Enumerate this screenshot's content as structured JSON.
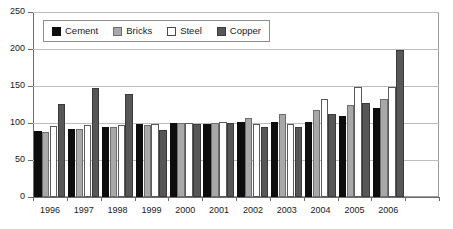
{
  "chart_data": {
    "type": "bar",
    "title": "",
    "subtitle": "",
    "xlabel": "",
    "ylabel": "",
    "ylim": [
      0,
      250
    ],
    "yticks": [
      0,
      50,
      100,
      150,
      200,
      250
    ],
    "ytick_labels": [
      "0",
      "50",
      "100",
      "150",
      "200",
      "250"
    ],
    "grid": true,
    "grid_axis": "y",
    "legend_position": "top-left-inside",
    "categories": [
      "1996",
      "1997",
      "1998",
      "1999",
      "2000",
      "2001",
      "2002",
      "2003",
      "2004",
      "2005",
      "2006"
    ],
    "series": [
      {
        "name": "Cement",
        "color": "#0d0d0d",
        "values": [
          89,
          92,
          95,
          98,
          100,
          99,
          101,
          102,
          102,
          110,
          120
        ]
      },
      {
        "name": "Bricks",
        "color": "#a8a8a8",
        "values": [
          88,
          92,
          95,
          97,
          100,
          100,
          107,
          112,
          117,
          124,
          132
        ]
      },
      {
        "name": "Steel",
        "color": "#ffffff",
        "values": [
          96,
          97,
          97,
          98,
          100,
          102,
          98,
          98,
          132,
          148,
          148
        ]
      },
      {
        "name": "Copper",
        "color": "#575757",
        "values": [
          126,
          147,
          139,
          90,
          99,
          100,
          94,
          95,
          112,
          127,
          198
        ]
      }
    ]
  },
  "legend": {
    "items": [
      {
        "label": "Cement",
        "swatch": "cement"
      },
      {
        "label": "Bricks",
        "swatch": "bricks"
      },
      {
        "label": "Steel",
        "swatch": "steel"
      },
      {
        "label": "Copper",
        "swatch": "copper"
      }
    ]
  }
}
